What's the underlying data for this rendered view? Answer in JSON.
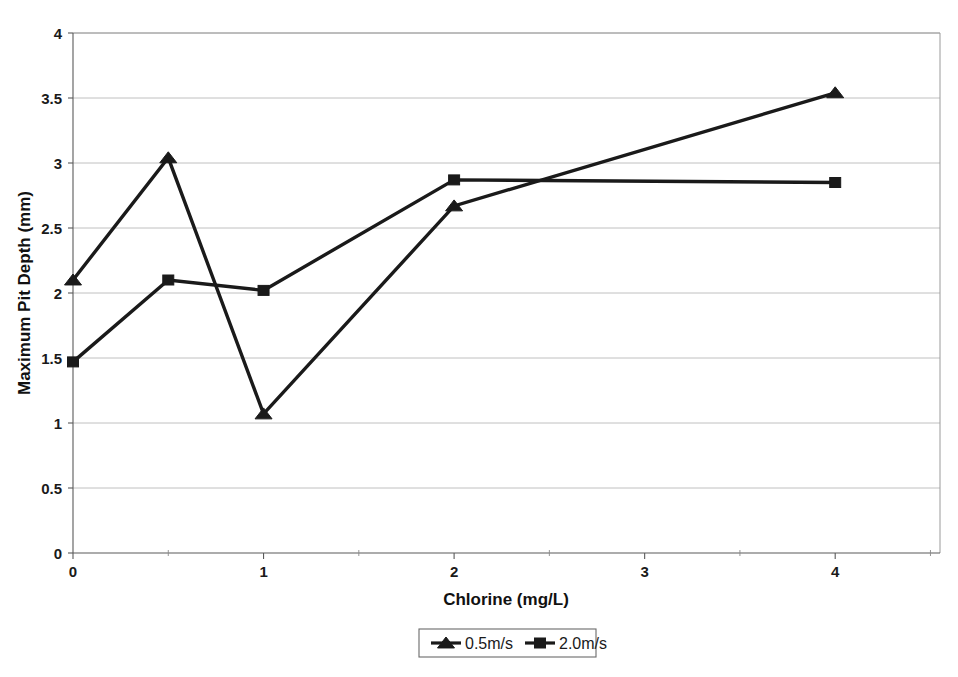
{
  "chart_data": {
    "type": "line",
    "title": "",
    "xlabel": "Chlorine (mg/L)",
    "ylabel": "Maximum Pit Depth (mm)",
    "xlim": [
      0,
      4.55
    ],
    "ylim": [
      0,
      4
    ],
    "x_ticks": [
      "0",
      "1",
      "2",
      "3",
      "4"
    ],
    "x_tick_values": [
      0,
      1,
      2,
      3,
      4
    ],
    "x_minor_tick_values": [
      0.5,
      1.5,
      2.5,
      3.5,
      4.5
    ],
    "y_ticks": [
      "0",
      "0.5",
      "1",
      "1.5",
      "2",
      "2.5",
      "3",
      "3.5",
      "4"
    ],
    "y_tick_values": [
      0,
      0.5,
      1,
      1.5,
      2,
      2.5,
      3,
      3.5,
      4
    ],
    "grid": "horizontal",
    "legend_position": "bottom",
    "series": [
      {
        "name": "0.5m/s",
        "marker": "triangle",
        "color": "#1a1a1a",
        "x": [
          0,
          0.5,
          1,
          2,
          4
        ],
        "values": [
          2.1,
          3.04,
          1.07,
          2.67,
          3.54
        ]
      },
      {
        "name": "2.0m/s",
        "marker": "square",
        "color": "#1a1a1a",
        "x": [
          0,
          0.5,
          1,
          2,
          4
        ],
        "values": [
          1.47,
          2.1,
          2.02,
          2.87,
          2.85
        ]
      }
    ]
  },
  "legend": {
    "entries": [
      {
        "label": "0.5m/s",
        "marker": "triangle"
      },
      {
        "label": "2.0m/s",
        "marker": "square"
      }
    ]
  },
  "axes": {
    "x_title": "Chlorine (mg/L)",
    "y_title": "Maximum Pit Depth (mm)"
  }
}
